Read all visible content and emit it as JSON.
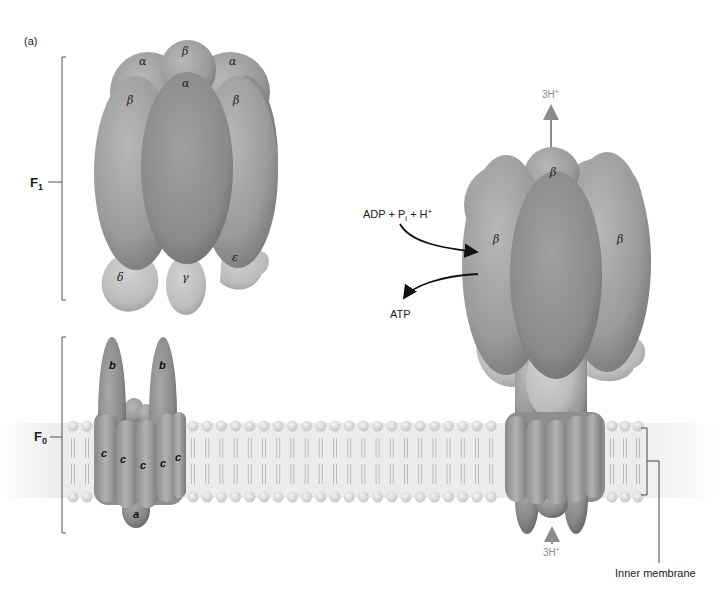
{
  "figure": {
    "panel_label": "(a)",
    "colors": {
      "background": "#ffffff",
      "protein_dark": "#7c7c7c",
      "protein_mid": "#999999",
      "protein_light": "#bdbdbd",
      "membrane_band": "#ececec",
      "lipid_head": "#d6d6d6",
      "arrow_black": "#111111",
      "arrow_gray": "#8a8a8a"
    }
  },
  "left_structure": {
    "f1_label": "F",
    "f1_sub": "1",
    "f0_label": "F",
    "f0_sub": "0",
    "f1_subunits": {
      "alpha_top_left": "α",
      "beta_top": "β",
      "alpha_top_right": "α",
      "beta_left": "β",
      "alpha_center": "α",
      "beta_right": "β",
      "delta": "δ",
      "gamma": "γ",
      "epsilon": "ε"
    },
    "f0_subunits": {
      "b_left": "b",
      "b_right": "b",
      "c1": "c",
      "c2": "c",
      "c3": "c",
      "c4": "c",
      "c5": "c",
      "a": "a"
    }
  },
  "right_structure": {
    "beta_top": "β",
    "beta_left": "β",
    "beta_right": "β",
    "proton_out_label": "3H",
    "proton_out_sup": "+",
    "proton_in_label": "3H",
    "proton_in_sup": "+",
    "substrate_label_a": "ADP + P",
    "substrate_label_sub": "i",
    "substrate_label_b": " + H",
    "substrate_label_sup": "+",
    "product_label": "ATP",
    "membrane_label": "Inner membrane"
  }
}
